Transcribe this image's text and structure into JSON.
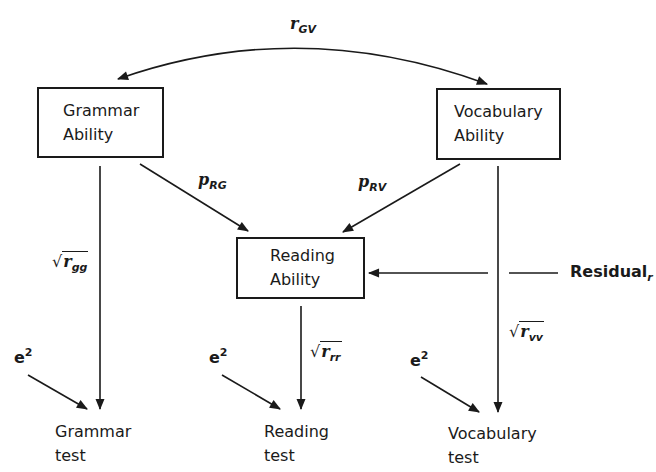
{
  "nodes": {
    "grammar_ability": {
      "line1": "Grammar",
      "line2": "Ability"
    },
    "vocabulary_ability": {
      "line1": "Vocabulary",
      "line2": "Ability"
    },
    "reading_ability": {
      "line1": "Reading",
      "line2": "Ability"
    }
  },
  "tests": {
    "grammar": {
      "line1": "Grammar",
      "line2": "test"
    },
    "reading": {
      "line1": "Reading",
      "line2": "test"
    },
    "vocabulary": {
      "line1": "Vocabulary",
      "line2": "test"
    }
  },
  "labels": {
    "r_gv": {
      "base": "r",
      "sub": "GV"
    },
    "p_rg": {
      "base": "p",
      "sub": "RG"
    },
    "p_rv": {
      "base": "p",
      "sub": "RV"
    },
    "sqrt_rgg": {
      "base": "r",
      "sub": "gg"
    },
    "sqrt_rrr": {
      "base": "r",
      "sub": "rr"
    },
    "sqrt_rvv": {
      "base": "r",
      "sub": "vv"
    },
    "residual": {
      "base": "Residual",
      "sub": "r"
    },
    "error": {
      "base": "e",
      "sup": "2"
    },
    "radical": "√"
  }
}
